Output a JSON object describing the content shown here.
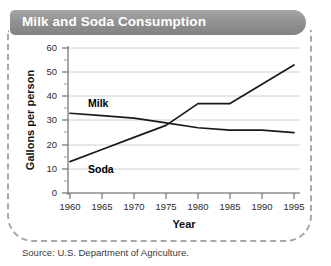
{
  "title": "Milk and Soda Consumption",
  "source": "Source: U.S. Department of Agriculture.",
  "colors": {
    "title_bar": "#8f8f8f",
    "title_text": "#ffffff",
    "frame_dash": "#a8a8a8",
    "gridline": "#d0d0d0",
    "axis": "#6f6f6f",
    "milk_line": "#1a1a1a",
    "soda_line": "#1a1a1a"
  },
  "chart_data": {
    "type": "line",
    "title": "Milk and Soda Consumption",
    "xlabel": "Year",
    "ylabel": "Gallons per person",
    "xlim": [
      1960,
      1995
    ],
    "ylim": [
      0,
      60
    ],
    "xticks": [
      1960,
      1965,
      1970,
      1975,
      1980,
      1985,
      1990,
      1995
    ],
    "yticks": [
      0,
      10,
      20,
      30,
      40,
      50,
      60
    ],
    "yminorticks": [
      5,
      15,
      25,
      35,
      45,
      55
    ],
    "grid": true,
    "legend": "inline-labels",
    "series": [
      {
        "name": "Milk",
        "x": [
          1960,
          1965,
          1970,
          1975,
          1980,
          1985,
          1990,
          1995
        ],
        "values": [
          33,
          32,
          31,
          29,
          27,
          26,
          26,
          25
        ]
      },
      {
        "name": "Soda",
        "x": [
          1960,
          1965,
          1970,
          1975,
          1980,
          1985,
          1990,
          1995
        ],
        "values": [
          13,
          18,
          23,
          28,
          37,
          37,
          45,
          53
        ]
      }
    ],
    "annotations": [
      {
        "text": "Milk",
        "x": 1963.5,
        "y": 37
      },
      {
        "text": "Soda",
        "x": 1963.5,
        "y": 10
      }
    ]
  },
  "axis": {
    "y_title": "Gallons per person",
    "x_title": "Year",
    "y_tick_labels": [
      "60",
      "50",
      "40",
      "30",
      "20",
      "10",
      "0"
    ],
    "x_tick_labels": [
      "1960",
      "1965",
      "1970",
      "1975",
      "1980",
      "1985",
      "1990",
      "1995"
    ]
  },
  "series_labels": {
    "milk": "Milk",
    "soda": "Soda"
  }
}
